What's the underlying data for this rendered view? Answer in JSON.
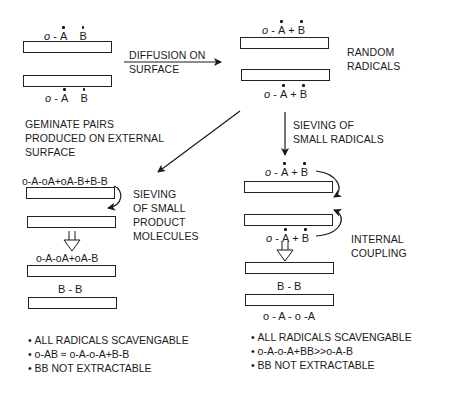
{
  "diagram": {
    "top_left": {
      "formula_top": {
        "o": "o",
        "sep": " - ",
        "A": "A",
        "B": "B"
      },
      "formula_bottom": {
        "o": "o",
        "sep": " - ",
        "A": "A",
        "B": "B"
      }
    },
    "arrow_diffusion_label": [
      "DIFFUSION ON",
      "SURFACE"
    ],
    "top_right": {
      "formula_top": {
        "o": "o",
        "sep": " - ",
        "A": "A",
        "plus": " + ",
        "B": "B"
      },
      "formula_bottom": {
        "o": "o",
        "sep": " - ",
        "A": "A",
        "plus": " + ",
        "B": "B"
      },
      "label": [
        "RANDOM",
        "RADICALS"
      ]
    },
    "geminate_label": [
      "GEMINATE PAIRS",
      "PRODUCED ON EXTERNAL",
      "SURFACE"
    ],
    "sieving_radicals_label": [
      "SIEVING OF",
      "SMALL RADICALS"
    ],
    "left_branch": {
      "formula_1": "o-A-oA+oA-B+B-B",
      "sieving_label": [
        "SIEVING",
        "OF SMALL",
        "PRODUCT",
        "MOLECULES"
      ],
      "formula_2": "o-A-oA+oA-B",
      "formula_3": "B - B",
      "bullets": [
        "ALL RADICALS SCAVENGABLE",
        "o-AB ≈ o-A-o-A+B-B",
        "BB NOT EXTRACTABLE"
      ]
    },
    "right_branch": {
      "formula_1": {
        "o": "o",
        "sep": " - ",
        "A": "A",
        "plus": " + ",
        "B": "B"
      },
      "formula_2": {
        "o": "o",
        "sep": " - ",
        "A": "A",
        "plus": " + ",
        "B": "B"
      },
      "coupling_label": [
        "INTERNAL",
        "COUPLING"
      ],
      "formula_3": "B - B",
      "formula_4": "o - A - o -A",
      "bullets": [
        "ALL RADICALS SCAVENGABLE",
        "o-A-o-A+BB>>o-A-B",
        "BB NOT EXTRACTABLE"
      ]
    },
    "colors": {
      "ink": "#1a1a1a",
      "background": "#ffffff"
    }
  }
}
